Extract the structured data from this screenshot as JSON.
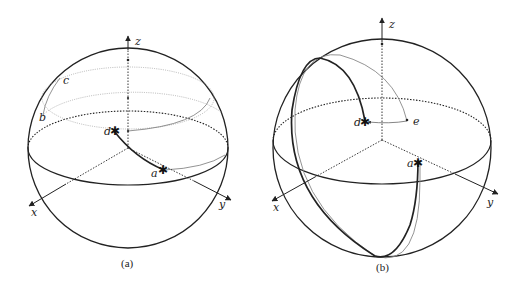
{
  "figure": {
    "panels": [
      {
        "id": "a",
        "caption": "(a)",
        "axes": {
          "x": "x",
          "y": "y",
          "z": "z"
        },
        "points": {
          "b": "b",
          "c": "c",
          "d": "d",
          "a": "a"
        }
      },
      {
        "id": "b",
        "caption": "(b)",
        "axes": {
          "x": "x",
          "y": "y",
          "z": "z"
        },
        "points": {
          "d": "d",
          "e": "e",
          "a": "a"
        }
      }
    ],
    "colors": {
      "stroke": "#222222",
      "thin_stroke": "#888888",
      "background": "#ffffff"
    }
  }
}
